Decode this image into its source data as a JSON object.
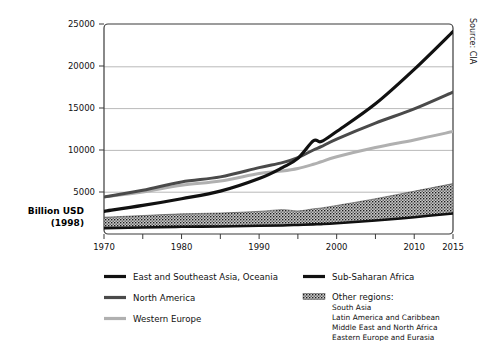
{
  "chart_data": {
    "type": "line",
    "title": "",
    "subtitle": "",
    "xlabel": "",
    "ylabel": "Billion USD\n(1998)",
    "ylabel_line1": "Billion USD",
    "ylabel_line2": "(1998)",
    "source_note": "Source: CIA",
    "xlim": [
      1970,
      2015
    ],
    "ylim": [
      0,
      25000
    ],
    "grid": "horizontal",
    "legend_position": "below-plot-two-columns",
    "x_ticks": [
      1970,
      1980,
      1990,
      2000,
      2010,
      2015
    ],
    "x_tick_labels": [
      "1970",
      "1980",
      "1990",
      "2000",
      "2010",
      "2015"
    ],
    "x_minor_ticks": [
      1975,
      1985,
      1995,
      2005
    ],
    "y_ticks": [
      5000,
      10000,
      15000,
      20000,
      25000
    ],
    "y_tick_labels": [
      "5000",
      "10000",
      "15000",
      "20000",
      "25000"
    ],
    "x": [
      1970,
      1975,
      1980,
      1985,
      1990,
      1993,
      1995,
      1997,
      1998,
      2000,
      2005,
      2010,
      2015
    ],
    "series": [
      {
        "name": "East and Southeast Asia, Oceania",
        "color": "#111111",
        "style": "line",
        "values": [
          2700,
          3400,
          4200,
          5100,
          6600,
          7900,
          9000,
          11100,
          11000,
          12200,
          15500,
          19600,
          24100
        ]
      },
      {
        "name": "North America",
        "color": "#4a4a4a",
        "style": "line",
        "values": [
          4400,
          5200,
          6200,
          6800,
          7900,
          8500,
          9100,
          10000,
          10400,
          11300,
          13200,
          14900,
          16900
        ]
      },
      {
        "name": "Western Europe",
        "color": "#b0b0b0",
        "style": "line",
        "values": [
          4400,
          5000,
          5800,
          6300,
          7200,
          7500,
          7800,
          8300,
          8600,
          9200,
          10300,
          11200,
          12200
        ]
      },
      {
        "name": "Sub-Saharan Africa",
        "color": "#111111",
        "style": "line",
        "values": [
          700,
          780,
          860,
          900,
          980,
          1020,
          1080,
          1150,
          1180,
          1280,
          1600,
          2000,
          2450
        ]
      },
      {
        "name": "Other regions",
        "color": "#555555",
        "style": "hatched-band",
        "note": "Filled hatched band between the Sub-Saharan Africa line and the band-top values",
        "band_top_values": [
          2000,
          2200,
          2400,
          2500,
          2700,
          2900,
          2750,
          3000,
          3100,
          3400,
          4200,
          5100,
          6000
        ],
        "band_bottom_values": [
          700,
          780,
          860,
          900,
          980,
          1020,
          1080,
          1150,
          1180,
          1280,
          1600,
          2000,
          2450
        ]
      }
    ]
  },
  "legend": {
    "left_column": [
      {
        "label": "East and Southeast Asia, Oceania",
        "swatch": "line",
        "color": "#111111"
      },
      {
        "label": "North America",
        "swatch": "line",
        "color": "#4a4a4a"
      },
      {
        "label": "Western Europe",
        "swatch": "line",
        "color": "#b0b0b0"
      }
    ],
    "right_column": [
      {
        "label": "Sub-Saharan Africa",
        "swatch": "line",
        "color": "#111111"
      },
      {
        "label": "Other regions:",
        "swatch": "hatch",
        "color": "#555555"
      }
    ],
    "other_regions_items": [
      "South Asia",
      "Latin America and Caribbean",
      "Middle East and North Africa",
      "Eastern Europe and Eurasia"
    ]
  }
}
